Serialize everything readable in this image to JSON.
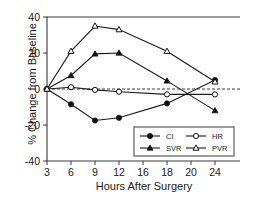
{
  "chart_data": {
    "type": "line",
    "title": "",
    "xlabel": "Hours After Surgery",
    "ylabel": "% Change from Baseline",
    "x": [
      3,
      6,
      9,
      12,
      18,
      24
    ],
    "xticklabels": [
      "3",
      "6",
      "9",
      "12",
      "16",
      "18",
      "20",
      "24"
    ],
    "xtickvalues": [
      3,
      6,
      9,
      12,
      16,
      18,
      20,
      24
    ],
    "yticklabels": [
      "40",
      "20",
      "0",
      "-20",
      "-40"
    ],
    "ytickvalues": [
      40,
      20,
      0,
      -20,
      -40
    ],
    "ylim": [
      -40,
      40
    ],
    "grid": false,
    "legend_position": "lower right",
    "zero_reference_line": true,
    "series": [
      {
        "name": "CI",
        "marker": "filled-circle",
        "values": [
          0,
          -8.5,
          -17.5,
          -16,
          -8,
          5
        ]
      },
      {
        "name": "HR",
        "marker": "open-circle",
        "values": [
          0,
          1,
          -0.5,
          -1.5,
          -3,
          -3
        ]
      },
      {
        "name": "SVR",
        "marker": "filled-triangle",
        "values": [
          0,
          7.5,
          19.5,
          20,
          4.5,
          -12
        ]
      },
      {
        "name": "PVR",
        "marker": "open-triangle",
        "values": [
          0,
          21,
          35,
          33,
          21,
          4
        ]
      }
    ]
  },
  "axes": {
    "ylabel_text": "% Change from Baseline",
    "xlabel_text": "Hours After Surgery"
  },
  "legend": {
    "entries": [
      {
        "label": "CI",
        "marker": "filled-circle"
      },
      {
        "label": "HR",
        "marker": "open-circle"
      },
      {
        "label": "SVR",
        "marker": "filled-triangle"
      },
      {
        "label": "PVR",
        "marker": "open-triangle"
      }
    ]
  },
  "colors": {
    "line": "#1a1a1a",
    "axis": "#3a3a3a",
    "background": "#ffffff"
  }
}
